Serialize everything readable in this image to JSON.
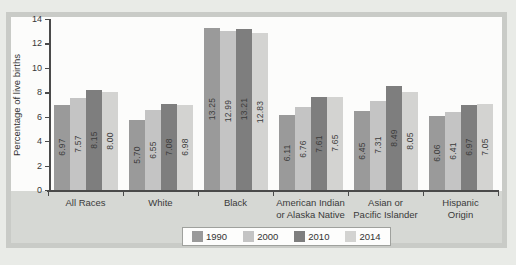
{
  "page": {
    "background": "#e9ebe7"
  },
  "figure": {
    "background": "#fcfcfb",
    "border_color": "#c9cbc7",
    "caption_panel_color": "#d6d8d4"
  },
  "axis": {
    "line_color": "#4a4a4a",
    "text_color": "#383838"
  },
  "chart_data": {
    "type": "bar",
    "title": "",
    "xlabel": "",
    "ylabel": "Percentage of live births",
    "ylim": [
      0,
      14
    ],
    "yticks": [
      0,
      2,
      4,
      6,
      8,
      10,
      12,
      14
    ],
    "grid": false,
    "legend_position": "bottom",
    "categories": [
      [
        "All Races"
      ],
      [
        "White"
      ],
      [
        "Black"
      ],
      [
        "American Indian",
        "or Alaska Native"
      ],
      [
        "Asian or",
        "Pacific Islander"
      ],
      [
        "Hispanic",
        "Origin"
      ]
    ],
    "series": [
      {
        "name": "1990",
        "color": "#9a9a9a",
        "values": [
          6.97,
          5.7,
          13.25,
          6.11,
          6.45,
          6.06
        ]
      },
      {
        "name": "2000",
        "color": "#c4c4c4",
        "values": [
          7.57,
          6.55,
          12.99,
          6.76,
          7.31,
          6.41
        ]
      },
      {
        "name": "2010",
        "color": "#7e7e7e",
        "values": [
          8.15,
          7.08,
          13.21,
          7.61,
          8.49,
          6.97
        ]
      },
      {
        "name": "2014",
        "color": "#d3d3d1",
        "values": [
          8.0,
          6.98,
          12.83,
          7.65,
          8.05,
          7.05
        ]
      }
    ],
    "value_labels_decimals": 2
  }
}
